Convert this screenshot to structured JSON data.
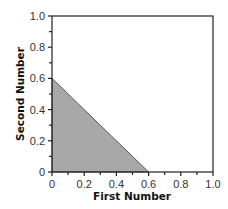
{
  "chart_data": {
    "type": "area",
    "title": "",
    "xlabel": "First Number",
    "ylabel": "Second Number",
    "xlim": [
      0,
      1.0
    ],
    "ylim": [
      0,
      1.0
    ],
    "grid": false,
    "legend": null,
    "x_ticks": [
      "0",
      "0.2",
      "0.4",
      "0.6",
      "0.8",
      "1.0"
    ],
    "y_ticks": [
      "0",
      "0.2",
      "0.4",
      "0.6",
      "0.8",
      "1.0"
    ],
    "minor_ticks_step": 0.1,
    "shaded_region": {
      "description": "Triangle region where First Number + Second Number <= 0.6",
      "vertices": [
        [
          0,
          0
        ],
        [
          0.6,
          0
        ],
        [
          0,
          0.6
        ]
      ],
      "fill_color": "#a8a8a8",
      "edge_color": "#555555"
    }
  },
  "colors": {
    "axis": "#222222",
    "fill": "#a8a8a8",
    "edge": "#555555"
  }
}
